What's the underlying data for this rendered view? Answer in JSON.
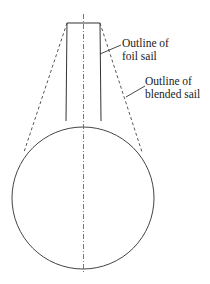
{
  "diagram": {
    "type": "sail-outline-comparison",
    "labels": {
      "foil_sail": [
        "Outline of",
        "foil sail"
      ],
      "blended_sail": [
        "Outline of",
        "blended sail"
      ]
    },
    "elements": {
      "centerline": "dash-dot vertical axis",
      "foil_sail": "solid trapezoid outline",
      "blended_sail": "dashed tangent lines to circle",
      "base": "circle"
    },
    "colors": {
      "line": "#333333",
      "background": "#ffffff"
    }
  }
}
